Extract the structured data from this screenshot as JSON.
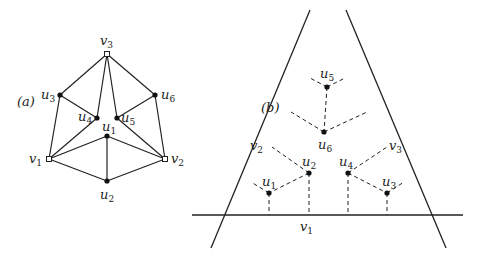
{
  "panel_a": {
    "label": "(a)",
    "nodes": [
      {
        "id": "v3",
        "name": "v",
        "sub": "3",
        "kind": "open"
      },
      {
        "id": "u3",
        "name": "u",
        "sub": "3",
        "kind": "filled"
      },
      {
        "id": "u6",
        "name": "u",
        "sub": "6",
        "kind": "filled"
      },
      {
        "id": "u4",
        "name": "u",
        "sub": "4",
        "kind": "filled"
      },
      {
        "id": "u5",
        "name": "u",
        "sub": "5",
        "kind": "filled"
      },
      {
        "id": "u1",
        "name": "u",
        "sub": "1",
        "kind": "filled"
      },
      {
        "id": "v1",
        "name": "v",
        "sub": "1",
        "kind": "open"
      },
      {
        "id": "v2",
        "name": "v",
        "sub": "2",
        "kind": "open"
      },
      {
        "id": "u2",
        "name": "u",
        "sub": "2",
        "kind": "filled"
      }
    ],
    "edges": [
      [
        "v3",
        "u3"
      ],
      [
        "v3",
        "u6"
      ],
      [
        "v3",
        "u4"
      ],
      [
        "v3",
        "u5"
      ],
      [
        "u3",
        "u4"
      ],
      [
        "u6",
        "u5"
      ],
      [
        "u3",
        "v1"
      ],
      [
        "u6",
        "v2"
      ],
      [
        "u4",
        "v1"
      ],
      [
        "u5",
        "v2"
      ],
      [
        "u1",
        "v1"
      ],
      [
        "u1",
        "v2"
      ],
      [
        "u1",
        "u2"
      ],
      [
        "v1",
        "u2"
      ],
      [
        "v2",
        "u2"
      ]
    ]
  },
  "panel_b": {
    "label": "(b)",
    "lines": [
      {
        "id": "v1",
        "name": "v",
        "sub": "1"
      },
      {
        "id": "v2",
        "name": "v",
        "sub": "2"
      },
      {
        "id": "v3",
        "name": "v",
        "sub": "3"
      }
    ],
    "points": [
      {
        "id": "u5",
        "name": "u",
        "sub": "5"
      },
      {
        "id": "u6",
        "name": "u",
        "sub": "6"
      },
      {
        "id": "u2",
        "name": "u",
        "sub": "2"
      },
      {
        "id": "u1",
        "name": "u",
        "sub": "1"
      },
      {
        "id": "u4",
        "name": "u",
        "sub": "4"
      },
      {
        "id": "u3",
        "name": "u",
        "sub": "3"
      }
    ]
  }
}
